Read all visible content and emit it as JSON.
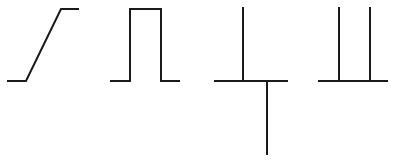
{
  "figure": {
    "name": "waveform-sequence",
    "width": 396,
    "height": 162,
    "background_color": "#ffffff",
    "stroke_color": "#1a1a1a",
    "stroke_width": 2
  },
  "chart_data": {
    "type": "line",
    "title": "",
    "subtitle": "",
    "xlabel": "",
    "ylabel": "",
    "grid": false,
    "legend": null,
    "axis_visible": false,
    "tick_labels": [],
    "annotations": [],
    "xlim": [
      0,
      396
    ],
    "ylim": [
      162,
      0
    ],
    "baseline_y": 81,
    "plateau_y": 9,
    "spike_top_y": 7,
    "spike_bottom_y": 155,
    "series": [
      {
        "name": "ramp",
        "label": "rising ramp",
        "panel": 1,
        "points": [
          [
            7,
            81
          ],
          [
            26,
            81
          ],
          [
            61,
            9
          ],
          [
            79,
            9
          ]
        ]
      },
      {
        "name": "rectangular-pulse",
        "label": "rectangular pulse",
        "panel": 2,
        "points": [
          [
            110,
            81
          ],
          [
            130,
            81
          ],
          [
            130,
            9
          ],
          [
            161,
            9
          ],
          [
            161,
            81
          ],
          [
            180,
            81
          ]
        ]
      },
      {
        "name": "impulse-pair",
        "label": "positive and negative impulse",
        "panel": 3,
        "points": [
          [
            214,
            81
          ],
          [
            243,
            81
          ],
          [
            243,
            7
          ],
          [
            243,
            81
          ],
          [
            267,
            81
          ],
          [
            267,
            155
          ],
          [
            267,
            81
          ],
          [
            288,
            81
          ]
        ]
      },
      {
        "name": "double-impulse",
        "label": "two positive impulses",
        "panel": 4,
        "points": [
          [
            318,
            81
          ],
          [
            339,
            81
          ],
          [
            339,
            7
          ],
          [
            339,
            81
          ],
          [
            370,
            81
          ],
          [
            370,
            7
          ],
          [
            370,
            81
          ],
          [
            388,
            81
          ]
        ]
      }
    ]
  }
}
